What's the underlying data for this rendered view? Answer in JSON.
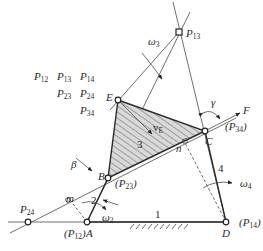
{
  "diagram": {
    "type": "four-bar linkage instant-center diagram",
    "legend_grid": [
      [
        "P12",
        "P13",
        "P14"
      ],
      [
        "",
        "P23",
        "P24"
      ],
      [
        "",
        "",
        "P34"
      ]
    ],
    "legend": {
      "p12": "P",
      "p12_sub": "12",
      "p13": "P",
      "p13_sub": "13",
      "p14": "P",
      "p14_sub": "14",
      "p23": "P",
      "p23_sub": "23",
      "p24": "P",
      "p24_sub": "24",
      "p34": "P",
      "p34_sub": "34"
    },
    "points": {
      "A": {
        "label": "A",
        "alias": "(P",
        "alias_sub": "12",
        "alias_close": ")"
      },
      "B": {
        "label": "B",
        "alias": "(P",
        "alias_sub": "23",
        "alias_close": ")"
      },
      "C": {
        "label": "C",
        "alias": "(P",
        "alias_sub": "34",
        "alias_close": ")"
      },
      "D": {
        "label": "D",
        "alias": "(P",
        "alias_sub": "14",
        "alias_close": ")"
      },
      "E": {
        "label": "E"
      },
      "P13": {
        "label": "P",
        "sub": "13"
      },
      "P24": {
        "label": "P",
        "sub": "24"
      }
    },
    "links": {
      "frame": "1",
      "crank": "2",
      "coupler": "3",
      "rocker": "4"
    },
    "annotations": {
      "omega2": "ω",
      "omega2_sub": "2",
      "omega3": "ω",
      "omega3_sub": "3",
      "omega4": "ω",
      "omega4_sub": "4",
      "vE": "v",
      "vE_sub": "E",
      "force": "F",
      "gamma": "γ",
      "beta": "β",
      "m": "m",
      "n": "n"
    }
  }
}
